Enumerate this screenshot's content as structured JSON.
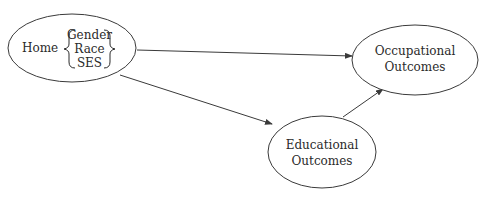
{
  "diagram": {
    "type": "path-diagram",
    "colors": {
      "stroke": "#3a3a3a",
      "text": "#2a2a2a",
      "background": "#ffffff"
    },
    "nodes": [
      {
        "id": "home",
        "label": "Home",
        "sublabels": [
          "Gender",
          "Race",
          "SES"
        ],
        "cx": 72,
        "cy": 48,
        "rx": 64,
        "ry": 34
      },
      {
        "id": "occupational",
        "label_lines": [
          "Occupational",
          "Outcomes"
        ],
        "cx": 415,
        "cy": 60,
        "rx": 63,
        "ry": 35
      },
      {
        "id": "educational",
        "label_lines": [
          "Educational",
          "Outcomes"
        ],
        "cx": 322,
        "cy": 152,
        "rx": 54,
        "ry": 36
      }
    ],
    "edges": [
      {
        "from": "home",
        "to": "occupational"
      },
      {
        "from": "home",
        "to": "educational"
      },
      {
        "from": "educational",
        "to": "occupational"
      }
    ]
  }
}
